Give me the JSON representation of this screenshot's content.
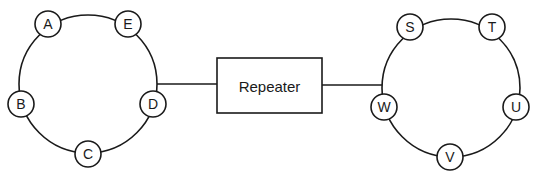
{
  "diagram": {
    "left_ring": {
      "nodes": [
        {
          "label": "A",
          "x": 48,
          "y": 24
        },
        {
          "label": "E",
          "x": 128,
          "y": 24
        },
        {
          "label": "B",
          "x": 21,
          "y": 104
        },
        {
          "label": "D",
          "x": 153,
          "y": 104
        },
        {
          "label": "C",
          "x": 88,
          "y": 154
        }
      ]
    },
    "repeater": {
      "label": "Repeater"
    },
    "right_ring": {
      "nodes": [
        {
          "label": "S",
          "x": 410,
          "y": 27
        },
        {
          "label": "T",
          "x": 492,
          "y": 27
        },
        {
          "label": "W",
          "x": 384,
          "y": 107
        },
        {
          "label": "U",
          "x": 516,
          "y": 107
        },
        {
          "label": "V",
          "x": 450,
          "y": 157
        }
      ]
    }
  }
}
